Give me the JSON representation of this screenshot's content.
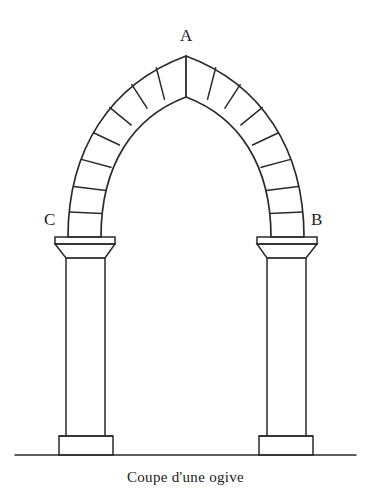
{
  "figure": {
    "kind": "architectural-line-drawing",
    "title": "Coupe d'une ogive",
    "caption": "Coupe d'une ogive",
    "background_color": "#ffffff",
    "line_color": "#2a2a2a",
    "label_color": "#1d1d1d",
    "canvas": {
      "width": 371,
      "height": 501
    },
    "labels": {
      "apex": "A",
      "right_spring": "B",
      "left_spring": "C"
    },
    "parts": {
      "arch": "pointed ogival arch of voussoirs",
      "left_column": "colonnette with capital, shaft and plinth",
      "right_column": "colonnette with capital, shaft and plinth",
      "ground": "ground line"
    },
    "geometry": {
      "apex_outer": {
        "x": 186,
        "y": 56
      },
      "apex_inner": {
        "x": 186,
        "y": 97
      },
      "left_spring_outer": {
        "x": 68,
        "y": 237
      },
      "left_spring_inner": {
        "x": 101,
        "y": 237
      },
      "right_spring_outer": {
        "x": 304,
        "y": 237
      },
      "right_spring_inner": {
        "x": 271,
        "y": 237
      },
      "voussoirs_per_side": 7,
      "arch_band_thickness": 33,
      "ground_line_y": 455,
      "ground_line_x0": 15,
      "ground_line_x1": 356,
      "left_column": {
        "abacus_left": 55,
        "abacus_right": 115,
        "abacus_top": 237,
        "abacus_bottom": 244,
        "echinus_bottom": 258,
        "shaft_left": 66,
        "shaft_right": 105,
        "shaft_top": 258,
        "shaft_bottom": 436,
        "plinth_left": 59,
        "plinth_right": 113,
        "plinth_top": 436,
        "plinth_bottom": 455
      },
      "right_column": {
        "abacus_left": 257,
        "abacus_right": 317,
        "abacus_top": 237,
        "abacus_bottom": 244,
        "echinus_bottom": 258,
        "shaft_left": 267,
        "shaft_right": 306,
        "shaft_top": 258,
        "shaft_bottom": 436,
        "plinth_left": 259,
        "plinth_right": 313,
        "plinth_top": 436,
        "plinth_bottom": 455
      }
    }
  }
}
